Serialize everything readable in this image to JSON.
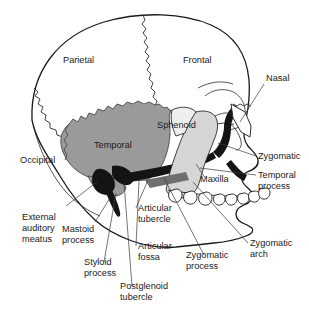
{
  "figure": {
    "background_color": "#ffffff",
    "ink_color": "#1a1a1a",
    "temporal_fill": "#9a9a9a",
    "maxilla_fill": "#d6d6d6",
    "dark_fill": "#141414",
    "leader_color": "#3a3a3a"
  },
  "bone_labels": {
    "parietal": "Parietal",
    "frontal": "Frontal",
    "occipital": "Occipital",
    "temporal": "Temporal",
    "sphenoid": "Sphenoid",
    "nasal": "Nasal",
    "zygomatic": "Zygomatic",
    "maxilla": "Maxilla"
  },
  "landmark_labels": {
    "temporal_process_line1": "Temporal",
    "temporal_process_line2": "process",
    "zygomatic_arch_line1": "Zygomatic",
    "zygomatic_arch_line2": "arch",
    "zygomatic_process_line1": "Zygomatic",
    "zygomatic_process_line2": "process",
    "articular_tubercle_line1": "Articular",
    "articular_tubercle_line2": "tubercle",
    "articular_fossa_line1": "Articular",
    "articular_fossa_line2": "fossa",
    "postglenoid_tubercle_line1": "Postglenoid",
    "postglenoid_tubercle_line2": "tubercle",
    "styloid_process_line1": "Styloid",
    "styloid_process_line2": "process",
    "mastoid_process_line1": "Mastoid",
    "mastoid_process_line2": "process",
    "external_auditory_meatus_line1": "External",
    "external_auditory_meatus_line2": "auditory",
    "external_auditory_meatus_line3": "meatus"
  }
}
